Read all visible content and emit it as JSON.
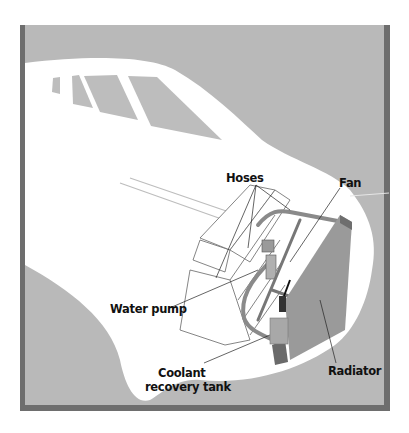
{
  "diagram": {
    "colors": {
      "panel_background": "#b9b9b9",
      "panel_border": "#6e6e6e",
      "car_body": "#ffffff",
      "window": "#bdbdbd",
      "radiator": "#9a9a9a",
      "radiator_side": "#7c7c7c",
      "hose": "#8e8e8e",
      "leader_line": "#222222",
      "label_text": "#111111"
    },
    "labels": {
      "hoses": "Hoses",
      "fan": "Fan",
      "water_pump": "Water pump",
      "coolant_line1": "Coolant",
      "coolant_line2": "recovery tank",
      "radiator": "Radiator"
    }
  }
}
